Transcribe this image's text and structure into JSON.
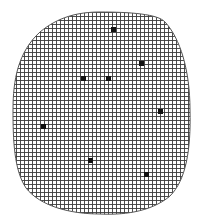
{
  "diagram": {
    "colors": {
      "background": "#ffffff",
      "grid_line": "#3a3a3a",
      "outline": "#555555",
      "marker": "#111111"
    },
    "grid": {
      "spacing_px": 4
    },
    "markers": [
      {
        "x": 113,
        "y": 29
      },
      {
        "x": 141,
        "y": 63
      },
      {
        "x": 83,
        "y": 78
      },
      {
        "x": 108,
        "y": 78
      },
      {
        "x": 160,
        "y": 111
      },
      {
        "x": 43,
        "y": 126
      },
      {
        "x": 90,
        "y": 160
      },
      {
        "x": 146,
        "y": 174
      }
    ],
    "marker_size_px": 4
  }
}
